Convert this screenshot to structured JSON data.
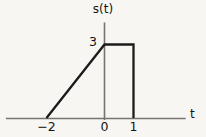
{
  "figure": {
    "background_color": "#f7f6f3",
    "axis_color": "#77746f",
    "signal_color": "#1b1b1b",
    "y_axis_label": "s(t)",
    "x_axis_label": "t",
    "amplitude_label": "3",
    "tick_labels": {
      "minus_two": "−2",
      "zero": "0",
      "one": "1"
    }
  },
  "chart_data": {
    "type": "line",
    "title": "",
    "subtitle": "",
    "xlabel": "t",
    "ylabel": "s(t)",
    "xlim": [
      -3.4,
      2.8
    ],
    "ylim": [
      0,
      3.9
    ],
    "xticks": [
      -2,
      0,
      1
    ],
    "xticklabels": [
      "−2",
      "0",
      "1"
    ],
    "yticks": [
      3
    ],
    "yticklabels": [
      "3"
    ],
    "grid": false,
    "legend": null,
    "annotations": [],
    "series": [
      {
        "name": "s(t)",
        "color": "#1b1b1b",
        "x": [
          -2,
          0,
          1,
          1
        ],
        "y": [
          0,
          3,
          3,
          0
        ],
        "description": "Ramp rising linearly from 0 at t=-2 to 3 at t=0, held constant at 3 until t=1, then dropping to 0."
      }
    ]
  }
}
